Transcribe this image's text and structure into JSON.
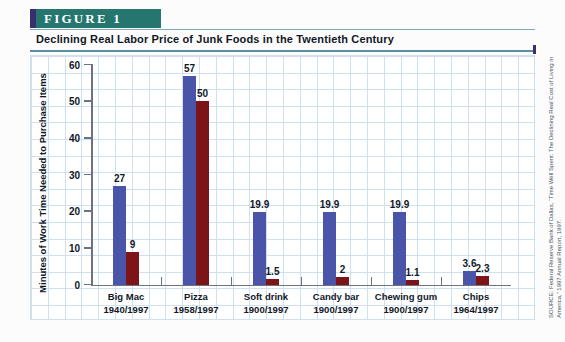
{
  "figure": {
    "banner_label": "FIGURE 1",
    "banner_color": "#24766f",
    "banner_accent_color": "#3a2f6e",
    "title": "Declining Real Labor Price of Junk Foods in the Twentieth Century"
  },
  "source_note": "SOURCE: Federal Reserve Bank of Dallas, “Time Well Spent: The Declining Real Cost of Living in America,” 1997 Annual Report, 1997.",
  "chart_data": {
    "type": "bar",
    "title": "Declining Real Labor Price of Junk Foods in the Twentieth Century",
    "xlabel": "",
    "ylabel": "Minutes of Work Time Needed to Purchase Items",
    "ylim": [
      0,
      60
    ],
    "yticks": [
      0,
      10,
      20,
      30,
      40,
      50,
      60
    ],
    "ytick_labels": [
      "0",
      "10",
      "20",
      "30",
      "40",
      "50",
      "60"
    ],
    "grid": true,
    "legend": "none",
    "categories": [
      "Big Mac",
      "Pizza",
      "Soft drink",
      "Candy bar",
      "Chewing gum",
      "Chips"
    ],
    "category_sublabels": [
      "1940/1997",
      "1958/1997",
      "1900/1997",
      "1900/1997",
      "1900/1997",
      "1964/1997"
    ],
    "series": [
      {
        "name": "Earlier year",
        "color": "#4a54a8",
        "values": [
          27,
          57,
          19.9,
          19.9,
          19.9,
          3.6
        ],
        "labels": [
          "27",
          "57",
          "19.9",
          "19.9",
          "19.9",
          "3.6"
        ]
      },
      {
        "name": "1997",
        "color": "#7d1418",
        "values": [
          9,
          50,
          1.5,
          2,
          1.1,
          2.3
        ],
        "labels": [
          "9",
          "50",
          "1.5",
          "2",
          "1.1",
          "2.3"
        ]
      }
    ]
  }
}
